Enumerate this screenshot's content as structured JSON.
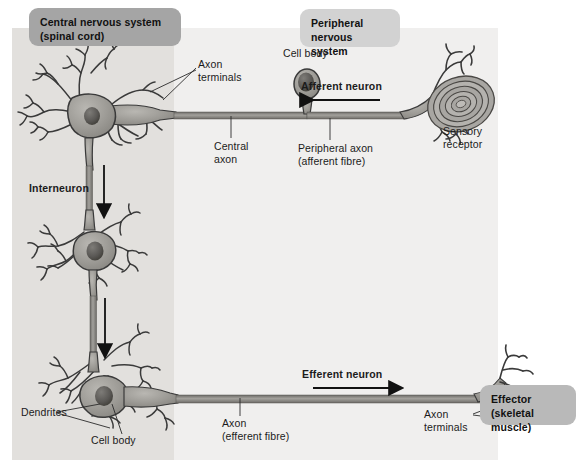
{
  "figure": {
    "title_boxes": {
      "cns": "Central nervous system\n(spinal cord)",
      "pns": "Peripheral\nnervous system",
      "effector": "Effector\n(skeletal muscle)"
    },
    "colors": {
      "cns_panel": "#e2e0dd",
      "pns_panel": "#f0efee",
      "cns_box": "#a5a5a5",
      "pns_box": "#d2d2d2",
      "effector_box": "#b9b9b9",
      "neuron_fill": "#9a9893",
      "neuron_stroke": "#3a3a3a",
      "nucleus": "#555350",
      "axon": "#8e8c88",
      "label_text": "#1b1b1b",
      "leader_line": "#2b2b2b"
    },
    "labels": [
      {
        "id": "axon-terminals-top",
        "text": "Axon\nterminals"
      },
      {
        "id": "cell-body-ganglion",
        "text": "Cell body"
      },
      {
        "id": "afferent-neuron",
        "text": "Afferent neuron",
        "bold": true
      },
      {
        "id": "central-axon",
        "text": "Central\naxon"
      },
      {
        "id": "peripheral-axon",
        "text": "Peripheral axon\n(afferent fibre)"
      },
      {
        "id": "sensory-receptor",
        "text": "Sensory\nreceptor"
      },
      {
        "id": "interneuron",
        "text": "Interneuron",
        "bold": true
      },
      {
        "id": "dendrites",
        "text": "Dendrites"
      },
      {
        "id": "cell-body-motor",
        "text": "Cell body"
      },
      {
        "id": "axon-efferent",
        "text": "Axon\n(efferent fibre)"
      },
      {
        "id": "efferent-neuron",
        "text": "Efferent neuron",
        "bold": true
      },
      {
        "id": "axon-terminals-bottom",
        "text": "Axon\nterminals"
      }
    ],
    "label_text": {
      "axon_terminals_top_line1": "Axon",
      "axon_terminals_top_line2": "terminals",
      "cell_body_ganglion": "Cell body",
      "afferent_neuron": "Afferent neuron",
      "central_axon_line1": "Central",
      "central_axon_line2": "axon",
      "peripheral_axon_line1": "Peripheral axon",
      "peripheral_axon_line2": "(afferent fibre)",
      "sensory_receptor_line1": "Sensory",
      "sensory_receptor_line2": "receptor",
      "interneuron": "Interneuron",
      "dendrites": "Dendrites",
      "cell_body_motor": "Cell body",
      "axon_efferent_line1": "Axon",
      "axon_efferent_line2": "(efferent fibre)",
      "efferent_neuron": "Efferent neuron",
      "axon_terminals_bottom_line1": "Axon",
      "axon_terminals_bottom_line2": "terminals"
    },
    "flow_arrows": [
      {
        "id": "afferent-arrow",
        "direction": "left",
        "meaning": "Afferent neuron signal toward CNS"
      },
      {
        "id": "interneuron-arrow-1",
        "direction": "down",
        "meaning": "signal down interneuron chain"
      },
      {
        "id": "interneuron-arrow-2",
        "direction": "down",
        "meaning": "signal down interneuron chain"
      },
      {
        "id": "efferent-arrow",
        "direction": "right",
        "meaning": "Efferent neuron signal toward effector"
      }
    ]
  }
}
